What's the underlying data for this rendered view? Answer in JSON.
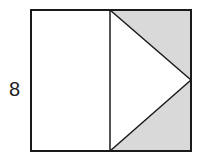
{
  "diagram": {
    "side_label": "8",
    "colors": {
      "stroke": "#1a1a1a",
      "shaded": "#d9d9d9",
      "background": "#ffffff"
    }
  }
}
